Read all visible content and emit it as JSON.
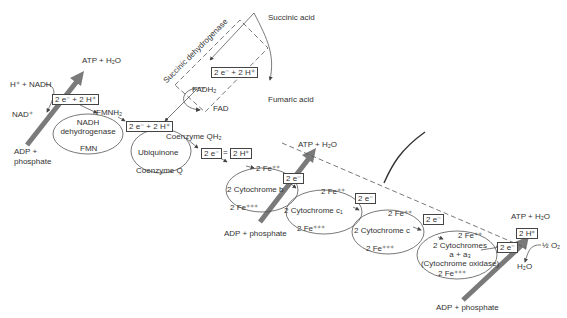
{
  "diagram": {
    "complexes": [
      {
        "id": "nadh",
        "label": "NADH dehydrogenase"
      },
      {
        "id": "succ",
        "label": "Succinic dehydrogenase"
      },
      {
        "id": "ubq",
        "label": "Ubiquinone"
      },
      {
        "id": "cytb",
        "label": "2 Cytochrome b"
      },
      {
        "id": "cytc1",
        "label": "2 Cytochrome c₁"
      },
      {
        "id": "cytc",
        "label": "2 Cytochrome c"
      },
      {
        "id": "cytaa3_1",
        "label": "2 Cytochromes"
      },
      {
        "id": "cytaa3_2",
        "label": "a + a₃"
      },
      {
        "id": "cytaa3_3",
        "label": "(Cytochrome oxidase)"
      }
    ],
    "labels": {
      "h_nadh": "H⁺ + NADH",
      "nad": "NAD⁺",
      "fmnh2": "FMNH₂",
      "fmn": "FMN",
      "atp1": "ATP + H₂O",
      "adp1": "ADP +",
      "adp1b": "phosphate",
      "succinic": "Succinic acid",
      "fumaric": "Fumaric acid",
      "fadh2": "FADH₂",
      "fad": "FAD",
      "coq_h2": "Coenzyme QH₂",
      "coq": "Coenzyme Q",
      "fe_b_red": "2 Fe⁺⁺",
      "fe_b_ox": "2 Fe⁺⁺⁺",
      "fe_c1_red": "2 Fe⁺⁺",
      "fe_c1_ox": "2 Fe⁺⁺⁺",
      "fe_c_red": "2 Fe⁺⁺",
      "fe_c_ox": "2 Fe⁺⁺⁺",
      "fe_a_red": "2 Fe⁺⁺",
      "fe_a_ox": "2 Fe⁺⁺⁺",
      "atp2": "ATP + H₂O",
      "adp2": "ADP + phosphate",
      "atp3": "ATP + H₂O",
      "adp3": "ADP + phosphate",
      "half_o2": "½ O₂",
      "h2o": "H₂O"
    },
    "boxes": {
      "b1": "2 e⁻ + 2 H⁺",
      "b2": "2 e⁻ + 2 H⁺",
      "b3": "2 e⁻ + 2 H⁺",
      "b4e": "2 e⁻",
      "b4h": "2 H⁺",
      "b5": "2 e⁻",
      "b6": "2 e⁻",
      "b7": "2 e⁻",
      "b8": "2 e⁻",
      "b9": "2 H⁺"
    },
    "colors": {
      "arrow": "#777777",
      "line": "#444444",
      "text": "#333333"
    }
  }
}
